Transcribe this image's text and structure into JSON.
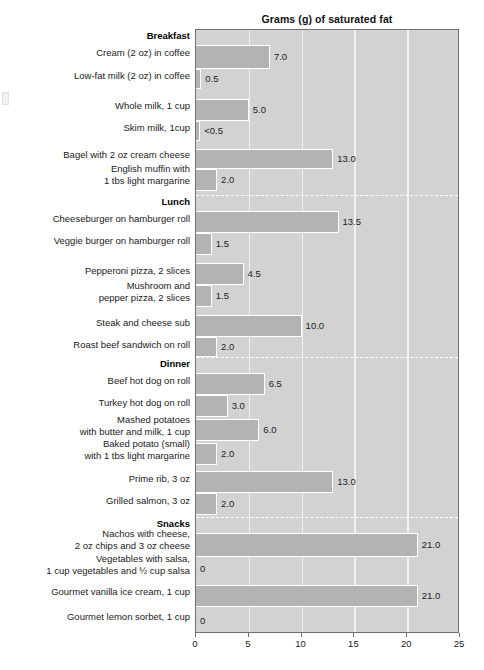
{
  "chart_data": {
    "type": "bar",
    "orientation": "horizontal",
    "title": "Grams (g) of saturated fat",
    "xlabel": "",
    "ylabel": "",
    "xlim": [
      0,
      25
    ],
    "xticks": [
      0,
      5,
      10,
      15,
      20,
      25
    ],
    "xtick_labels": [
      "0",
      "5",
      "10",
      "15",
      "20",
      "25"
    ],
    "grid": true,
    "legend": "none",
    "sections": [
      "Breakfast",
      "Lunch",
      "Dinner",
      "Snacks"
    ],
    "categories": [
      "Cream (2 oz) in coffee",
      "Low-fat milk (2 oz) in coffee",
      "Whole milk, 1 cup",
      "Skim milk, 1cup",
      "Bagel with 2 oz cream cheese",
      "English muffin with\n1 tbs light margarine",
      "Cheeseburger on hamburger roll",
      "Veggie burger on hamburger roll",
      "Pepperoni pizza, 2 slices",
      "Mushroom and\npepper pizza, 2 slices",
      "Steak and cheese sub",
      "Roast beef sandwich on roll",
      "Beef hot dog on roll",
      "Turkey hot dog on roll",
      "Mashed potatoes\nwith butter and milk, 1 cup",
      "Baked potato (small)\nwith 1 tbs light margarine",
      "Prime rib, 3 oz",
      "Grilled salmon, 3 oz",
      "Nachos with cheese,\n2 oz chips and 3 oz cheese",
      "Vegetables with salsa,\n1 cup vegetables and ½ cup salsa",
      "Gourmet vanilla ice cream, 1 cup",
      "Gourmet lemon sorbet, 1 cup"
    ],
    "values": [
      7.0,
      0.5,
      5.0,
      0.4,
      13.0,
      2.0,
      13.5,
      1.5,
      4.5,
      1.5,
      10.0,
      2.0,
      6.5,
      3.0,
      6.0,
      2.0,
      13.0,
      2.0,
      21.0,
      0,
      21.0,
      0
    ],
    "value_labels": [
      "7.0",
      "0.5",
      "5.0",
      "<0.5",
      "13.0",
      "2.0",
      "13.5",
      "1.5",
      "4.5",
      "1.5",
      "10.0",
      "2.0",
      "6.5",
      "3.0",
      "6.0",
      "2.0",
      "13.0",
      "2.0",
      "21.0",
      "0",
      "21.0",
      "0"
    ]
  },
  "rows": [
    {
      "kind": "section",
      "label": "Breakfast",
      "top": 30,
      "height": 14
    },
    {
      "kind": "bar",
      "label": "Cream (2 oz) in coffee",
      "value": 7.0,
      "value_label": "7.0",
      "top": 44,
      "height": 24,
      "label_top": 47
    },
    {
      "kind": "bar",
      "label": "Low-fat milk (2 oz) in coffee",
      "value": 0.5,
      "value_label": "0.5",
      "top": 68,
      "height": 20,
      "label_top": 70
    },
    {
      "kind": "gap",
      "top": 88,
      "height": 10
    },
    {
      "kind": "bar",
      "label": "Whole milk, 1 cup",
      "value": 5.0,
      "value_label": "5.0",
      "top": 98,
      "height": 22,
      "label_top": 100
    },
    {
      "kind": "bar",
      "label": "Skim milk, 1cup",
      "value": 0.4,
      "value_label": "<0.5",
      "top": 120,
      "height": 20,
      "label_top": 122
    },
    {
      "kind": "gap",
      "top": 140,
      "height": 8
    },
    {
      "kind": "bar",
      "label": "Bagel with 2 oz cream cheese",
      "value": 13.0,
      "value_label": "13.0",
      "top": 148,
      "height": 20,
      "label_top": 149
    },
    {
      "kind": "bar",
      "label": "English muffin with\n1 tbs light margarine",
      "value": 2.0,
      "value_label": "2.0",
      "top": 168,
      "height": 22,
      "label_top": 163
    },
    {
      "kind": "section",
      "label": "Lunch",
      "top": 196,
      "height": 14,
      "separator_top": 194
    },
    {
      "kind": "bar",
      "label": "Cheeseburger on hamburger roll",
      "value": 13.5,
      "value_label": "13.5",
      "top": 210,
      "height": 22,
      "label_top": 213
    },
    {
      "kind": "bar",
      "label": "Veggie burger on hamburger roll",
      "value": 1.5,
      "value_label": "1.5",
      "top": 232,
      "height": 22,
      "label_top": 235
    },
    {
      "kind": "gap",
      "top": 254,
      "height": 8
    },
    {
      "kind": "bar",
      "label": "Pepperoni pizza, 2 slices",
      "value": 4.5,
      "value_label": "4.5",
      "top": 262,
      "height": 22,
      "label_top": 265
    },
    {
      "kind": "bar",
      "label": "Mushroom and\npepper pizza, 2 slices",
      "value": 1.5,
      "value_label": "1.5",
      "top": 284,
      "height": 22,
      "label_top": 280
    },
    {
      "kind": "gap",
      "top": 306,
      "height": 8
    },
    {
      "kind": "bar",
      "label": "Steak and cheese sub",
      "value": 10.0,
      "value_label": "10.0",
      "top": 314,
      "height": 22,
      "label_top": 317
    },
    {
      "kind": "bar",
      "label": "Roast beef sandwich on roll",
      "value": 2.0,
      "value_label": "2.0",
      "top": 336,
      "height": 20,
      "label_top": 339
    },
    {
      "kind": "section",
      "label": "Dinner",
      "top": 358,
      "height": 14,
      "separator_top": 356
    },
    {
      "kind": "bar",
      "label": "Beef hot dog on roll",
      "value": 6.5,
      "value_label": "6.5",
      "top": 372,
      "height": 22,
      "label_top": 375
    },
    {
      "kind": "bar",
      "label": "Turkey hot dog on roll",
      "value": 3.0,
      "value_label": "3.0",
      "top": 394,
      "height": 22,
      "label_top": 397
    },
    {
      "kind": "bar",
      "label": "Mashed potatoes\nwith butter and milk, 1 cup",
      "value": 6.0,
      "value_label": "6.0",
      "top": 418,
      "height": 22,
      "label_top": 414
    },
    {
      "kind": "bar",
      "label": "Baked potato (small)\nwith 1 tbs light margarine",
      "value": 2.0,
      "value_label": "2.0",
      "top": 442,
      "height": 22,
      "label_top": 438
    },
    {
      "kind": "gap",
      "top": 464,
      "height": 6
    },
    {
      "kind": "bar",
      "label": "Prime rib, 3 oz",
      "value": 13.0,
      "value_label": "13.0",
      "top": 470,
      "height": 22,
      "label_top": 473
    },
    {
      "kind": "bar",
      "label": "Grilled salmon, 3 oz",
      "value": 2.0,
      "value_label": "2.0",
      "top": 492,
      "height": 22,
      "label_top": 495
    },
    {
      "kind": "section",
      "label": "Snacks",
      "top": 518,
      "height": 14,
      "separator_top": 516
    },
    {
      "kind": "bar",
      "label": "Nachos with cheese,\n2 oz chips and 3 oz cheese",
      "value": 21.0,
      "value_label": "21.0",
      "top": 532,
      "height": 24,
      "label_top": 528
    },
    {
      "kind": "bar",
      "label": "Vegetables with salsa,\n1 cup vegetables and ½ cup salsa",
      "value": 0,
      "value_label": "0",
      "top": 556,
      "height": 24,
      "label_top": 553
    },
    {
      "kind": "bar",
      "label": "Gourmet vanilla ice cream, 1 cup",
      "value": 21.0,
      "value_label": "21.0",
      "top": 584,
      "height": 22,
      "label_top": 586
    },
    {
      "kind": "bar",
      "label": "Gourmet lemon sorbet, 1 cup",
      "value": 0,
      "value_label": "0",
      "top": 608,
      "height": 24,
      "label_top": 611
    }
  ],
  "colors": {
    "bar_fill": "#b3b3b3",
    "bar_border": "#ffffff",
    "plot_background": "#d2d2d2",
    "gridline": "#f2f2f2",
    "plot_border": "#707070",
    "text": "#1a1a1a",
    "page_background": "#ffffff"
  }
}
